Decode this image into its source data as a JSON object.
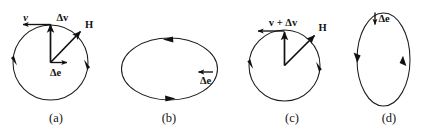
{
  "figure": {
    "background_color": "#ffffff",
    "ink_color": "#111111",
    "panels": [
      {
        "id": "a",
        "caption": "(a)",
        "shape": "circle",
        "labels": {
          "velocity": "v",
          "delta_v": "Δv",
          "field": "H",
          "delta_e": "Δe"
        }
      },
      {
        "id": "b",
        "caption": "(b)",
        "shape": "horizontal-ellipse",
        "labels": {
          "delta_e": "Δe"
        }
      },
      {
        "id": "c",
        "caption": "(c)",
        "shape": "circle",
        "labels": {
          "velocity_sum": "v + Δv",
          "field": "H"
        }
      },
      {
        "id": "d",
        "caption": "(d)",
        "shape": "vertical-ellipse",
        "labels": {
          "delta_e": "Δe"
        }
      }
    ]
  }
}
